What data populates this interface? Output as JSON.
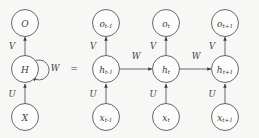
{
  "figure": {
    "equals_sign": "=",
    "background_color": "#f7f7f5",
    "line_color": "#55585a",
    "text_color": "#3a3c3e",
    "node_fill": "#fcfcfb"
  },
  "folded": {
    "output_node": {
      "base": "O",
      "sub": ""
    },
    "hidden_node": {
      "base": "H",
      "sub": ""
    },
    "input_node": {
      "base": "X",
      "sub": ""
    },
    "edge_input_to_hidden": "U",
    "edge_hidden_to_output": "V",
    "self_loop": "W"
  },
  "unfolded": {
    "steps": [
      {
        "output_node": {
          "base": "o",
          "sub": "t-1"
        },
        "hidden_node": {
          "base": "h",
          "sub": "t-1"
        },
        "input_node": {
          "base": "x",
          "sub": "t-1"
        },
        "edge_input_to_hidden": "U",
        "edge_hidden_to_output": "V",
        "edge_to_next": "W"
      },
      {
        "output_node": {
          "base": "o",
          "sub": "t"
        },
        "hidden_node": {
          "base": "h",
          "sub": "t"
        },
        "input_node": {
          "base": "x",
          "sub": "t"
        },
        "edge_input_to_hidden": "U",
        "edge_hidden_to_output": "V",
        "edge_to_next": "W"
      },
      {
        "output_node": {
          "base": "o",
          "sub": "t+1"
        },
        "hidden_node": {
          "base": "h",
          "sub": "t+1"
        },
        "input_node": {
          "base": "x",
          "sub": "t+1"
        },
        "edge_input_to_hidden": "U",
        "edge_hidden_to_output": "V",
        "edge_to_next": ""
      }
    ]
  }
}
